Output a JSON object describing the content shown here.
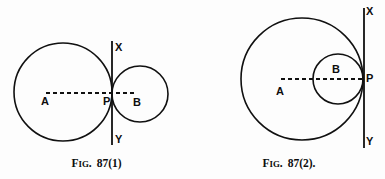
{
  "document": {
    "background_color": "#fdfdfd",
    "ink_color": "#101010",
    "figure_count": 2
  },
  "figures": [
    {
      "id": "figure-1",
      "caption": {
        "prefix_first": "F",
        "prefix_rest": "IG",
        "separator": ".",
        "number": "87(1)"
      },
      "labels": {
        "center_a": "A",
        "center_b": "B",
        "tangent_point": "P",
        "line_top": "X",
        "line_bottom": "Y"
      },
      "geometry": {
        "type": "externally-tangent-circles",
        "circle_a": {
          "cx": 63,
          "cy": 92,
          "r": 49
        },
        "circle_b": {
          "cx": 140,
          "cy": 94,
          "r": 28
        },
        "tangent_line": {
          "x": 112,
          "y_top": 41,
          "y_bottom": 145
        },
        "radius_line": {
          "x1": 46,
          "y1": 93,
          "x2": 134,
          "y2": 93
        },
        "tangent_point": {
          "x": 112,
          "y": 93
        }
      }
    },
    {
      "id": "figure-2",
      "caption": {
        "prefix_first": "F",
        "prefix_rest": "IG",
        "separator": ".",
        "number": "87(2)."
      },
      "labels": {
        "center_a": "A",
        "center_b": "B",
        "tangent_point": "P",
        "line_top": "X",
        "line_bottom": "Y"
      },
      "geometry": {
        "type": "internally-tangent-circles",
        "circle_a": {
          "cx": 302,
          "cy": 79,
          "r": 61
        },
        "circle_b": {
          "cx": 338,
          "cy": 79,
          "r": 25
        },
        "tangent_line": {
          "x": 364,
          "y_top": 8,
          "y_bottom": 148
        },
        "radius_line": {
          "x1": 281,
          "y1": 79,
          "x2": 362,
          "y2": 79
        },
        "tangent_point": {
          "x": 364,
          "y": 79
        }
      }
    }
  ]
}
